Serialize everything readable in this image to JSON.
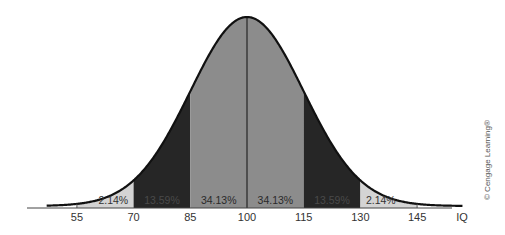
{
  "chart_data": {
    "type": "area",
    "title": "",
    "xlabel": "IQ",
    "ylabel": "",
    "distribution": "normal",
    "mean": 100,
    "sd": 15,
    "x_ticks": [
      55,
      70,
      85,
      100,
      115,
      130,
      145
    ],
    "xlim": [
      47,
      157
    ],
    "grid": false,
    "legend": null,
    "regions": [
      {
        "from": 55,
        "to": 70,
        "percent": "2.14%",
        "fill": "#d4d4d4",
        "label_color": "#333333"
      },
      {
        "from": 70,
        "to": 85,
        "percent": "13.59%",
        "fill": "#262626",
        "label_color": "#4a4a4a"
      },
      {
        "from": 85,
        "to": 100,
        "percent": "34.13%",
        "fill": "#8c8c8c",
        "label_color": "#2a2a2a"
      },
      {
        "from": 100,
        "to": 115,
        "percent": "34.13%",
        "fill": "#8c8c8c",
        "label_color": "#2a2a2a"
      },
      {
        "from": 115,
        "to": 130,
        "percent": "13.59%",
        "fill": "#262626",
        "label_color": "#4a4a4a"
      },
      {
        "from": 130,
        "to": 145,
        "percent": "2.14%",
        "fill": "#d4d4d4",
        "label_color": "#333333"
      }
    ],
    "annotations": [
      "© Cengage Learning®"
    ]
  },
  "axis": {
    "labels": [
      "55",
      "70",
      "85",
      "100",
      "115",
      "130",
      "145"
    ],
    "unit_label": "IQ"
  },
  "credit": "© Cengage Learning®"
}
